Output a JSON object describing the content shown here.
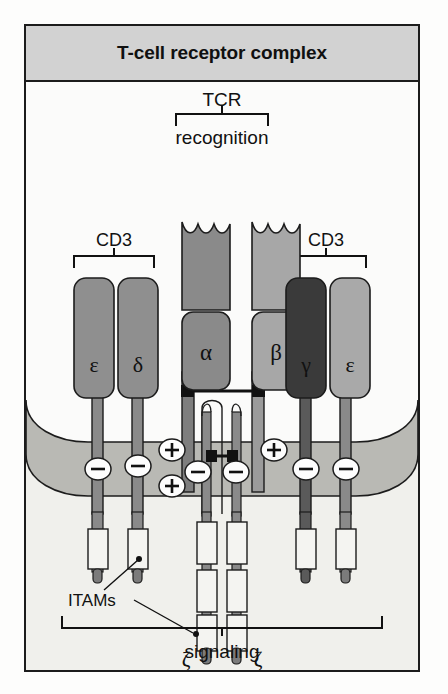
{
  "figure": {
    "title": "T-cell receptor complex",
    "background_color": "#f2f2ef",
    "border_color": "#1c1c1c",
    "title_bar_color": "#d2d2d2"
  },
  "labels": {
    "tcr": "TCR",
    "recognition": "recognition",
    "cd3_left": "CD3",
    "cd3_right": "CD3",
    "itams": "ITAMs",
    "signaling": "signaling"
  },
  "chains": [
    {
      "id": "cd3-epsilon-left",
      "greek": "ε",
      "name": "epsilon",
      "color": "#8f8f8f",
      "group": "CD3-left"
    },
    {
      "id": "cd3-delta",
      "greek": "δ",
      "name": "delta",
      "color": "#8f8f8f",
      "group": "CD3-left"
    },
    {
      "id": "tcr-alpha",
      "greek": "α",
      "name": "alpha",
      "color": "#8a8a8a",
      "group": "TCR"
    },
    {
      "id": "tcr-beta",
      "greek": "β",
      "name": "beta",
      "color": "#a7a7a7",
      "group": "TCR"
    },
    {
      "id": "cd3-gamma",
      "greek": "γ",
      "name": "gamma",
      "color": "#3a3a3a",
      "group": "CD3-right"
    },
    {
      "id": "cd3-epsilon-right",
      "greek": "ε",
      "name": "epsilon",
      "color": "#a9a9a9",
      "group": "CD3-right"
    },
    {
      "id": "zeta-left",
      "greek": "ζ",
      "name": "zeta",
      "color": "#8a8a8a",
      "group": "zeta"
    },
    {
      "id": "zeta-right",
      "greek": "ζ",
      "name": "zeta",
      "color": "#8a8a8a",
      "group": "zeta"
    }
  ],
  "zeta_labels": {
    "left": "ζ",
    "right": "ζ"
  },
  "charges": {
    "negative_symbol": "−",
    "positive_symbol": "+",
    "items": [
      {
        "id": "charge-eps-left",
        "sign": "negative",
        "x": 72,
        "y": 65
      },
      {
        "id": "charge-delta",
        "sign": "negative",
        "x": 112,
        "y": 62
      },
      {
        "id": "charge-alpha-pos1",
        "sign": "positive",
        "x": 148,
        "y": 46
      },
      {
        "id": "charge-alpha-pos2",
        "sign": "positive",
        "x": 148,
        "y": 84
      },
      {
        "id": "charge-zeta-left",
        "sign": "negative",
        "x": 178,
        "y": 66
      },
      {
        "id": "charge-zeta-right",
        "sign": "negative",
        "x": 212,
        "y": 66
      },
      {
        "id": "charge-beta-pos",
        "sign": "positive",
        "x": 248,
        "y": 46
      },
      {
        "id": "charge-gamma",
        "sign": "negative",
        "x": 280,
        "y": 65
      },
      {
        "id": "charge-eps-right",
        "sign": "negative",
        "x": 320,
        "y": 65
      }
    ]
  },
  "membrane": {
    "color": "#b9b9b4",
    "cytoplasm_color": "#f0f0ec",
    "extracellular_color": "#fbfbfa"
  },
  "itam_boxes": {
    "cd3_per_chain": 1,
    "zeta_per_chain": 3,
    "box_color": "#f4f4f1"
  },
  "disulfide": {
    "color": "#111111",
    "description": "alpha-beta interchain disulfide and zeta-zeta disulfide"
  }
}
